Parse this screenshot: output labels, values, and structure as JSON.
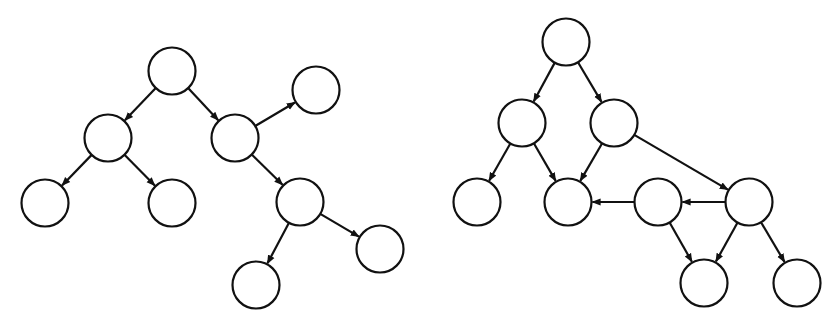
{
  "diagram": {
    "title": "",
    "graphs": [
      {
        "name": "tree",
        "nodes": [
          {
            "id": "a"
          },
          {
            "id": "b"
          },
          {
            "id": "c"
          },
          {
            "id": "d"
          },
          {
            "id": "e"
          },
          {
            "id": "f"
          },
          {
            "id": "g"
          },
          {
            "id": "h"
          },
          {
            "id": "i"
          }
        ],
        "edges": [
          {
            "from": "a",
            "to": "b"
          },
          {
            "from": "a",
            "to": "c"
          },
          {
            "from": "c",
            "to": "d"
          },
          {
            "from": "b",
            "to": "e"
          },
          {
            "from": "b",
            "to": "f"
          },
          {
            "from": "c",
            "to": "g"
          },
          {
            "from": "g",
            "to": "h"
          },
          {
            "from": "g",
            "to": "i"
          }
        ]
      },
      {
        "name": "dag",
        "nodes": [
          {
            "id": "a"
          },
          {
            "id": "b"
          },
          {
            "id": "c"
          },
          {
            "id": "d"
          },
          {
            "id": "e"
          },
          {
            "id": "f"
          },
          {
            "id": "g"
          },
          {
            "id": "h"
          },
          {
            "id": "i"
          }
        ],
        "edges": [
          {
            "from": "a",
            "to": "b"
          },
          {
            "from": "a",
            "to": "c"
          },
          {
            "from": "b",
            "to": "d"
          },
          {
            "from": "b",
            "to": "e"
          },
          {
            "from": "c",
            "to": "e"
          },
          {
            "from": "c",
            "to": "g"
          },
          {
            "from": "f",
            "to": "e"
          },
          {
            "from": "g",
            "to": "f"
          },
          {
            "from": "f",
            "to": "h"
          },
          {
            "from": "g",
            "to": "h"
          },
          {
            "from": "g",
            "to": "i"
          }
        ]
      }
    ]
  }
}
